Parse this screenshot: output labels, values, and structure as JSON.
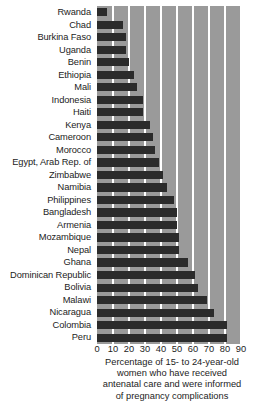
{
  "chart_data": {
    "type": "bar",
    "orientation": "horizontal",
    "title": "",
    "subtitle": "",
    "xlabel": "Percentage of 15- to 24-year-old women who have received antenatal care and were informed of pregnancy complications",
    "ylabel": "",
    "xlim": [
      0,
      90
    ],
    "grid": true,
    "legend": null,
    "xticks": [
      "0",
      "10",
      "20",
      "30",
      "40",
      "50",
      "60",
      "70",
      "80",
      "90"
    ],
    "xtick_values": [
      0,
      10,
      20,
      30,
      40,
      50,
      60,
      70,
      80,
      90
    ],
    "categories": [
      "Rwanda",
      "Chad",
      "Burkina Faso",
      "Uganda",
      "Benin",
      "Ethiopia",
      "Mali",
      "Indonesia",
      "Haiti",
      "Kenya",
      "Cameroon",
      "Morocco",
      "Egypt, Arab Rep. of",
      "Zimbabwe",
      "Namibia",
      "Philippines",
      "Bangladesh",
      "Armenia",
      "Mozambique",
      "Nepal",
      "Ghana",
      "Dominican Republic",
      "Bolivia",
      "Malawi",
      "Nicaragua",
      "Colombia",
      "Peru"
    ],
    "values": [
      6,
      16,
      18,
      18,
      20,
      23,
      25,
      29,
      29,
      33,
      35,
      36,
      39,
      41,
      44,
      48,
      50,
      50,
      51,
      51,
      57,
      61,
      63,
      69,
      73,
      81,
      81
    ]
  },
  "axis_caption": {
    "line1": "Percentage of 15- to 24-year-old",
    "line2": "women who have received",
    "line3": "antenatal care and were informed",
    "line4": "of pregnancy complications"
  },
  "style": {
    "plot_background": "#9a9a9a",
    "bar_color": "#2b2b2b",
    "gridline_color": "#ffffff",
    "text_color": "#1c1c1c",
    "page_background": "#ffffff"
  }
}
